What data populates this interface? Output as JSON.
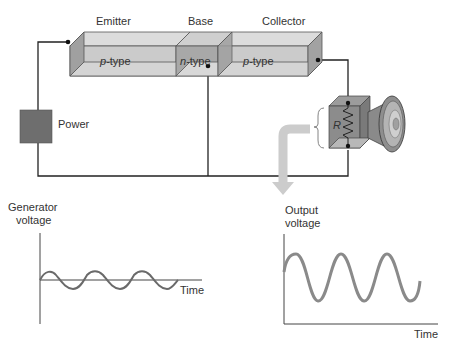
{
  "diagram": {
    "regions": [
      {
        "label": "Emitter",
        "type_prefix": "p",
        "type_suffix": "-type"
      },
      {
        "label": "Base",
        "type_prefix": "n",
        "type_suffix": "-type"
      },
      {
        "label": "Collector",
        "type_prefix": "p",
        "type_suffix": "-type"
      }
    ],
    "power_label": "Power",
    "resistor_label": "R",
    "speaker": "speaker-icon",
    "arrow": "down-arrow"
  },
  "graphs": {
    "input": {
      "ylabel_line1": "Generator",
      "ylabel_line2": "voltage",
      "xlabel": "Time",
      "amplitude": "small",
      "cycles": 3
    },
    "output": {
      "ylabel_line1": "Output",
      "ylabel_line2": "voltage",
      "xlabel": "Time",
      "amplitude": "large",
      "cycles": 3
    }
  },
  "colors": {
    "block_face": "#c8c8c8",
    "block_top": "#dadada",
    "block_side": "#9a9a9a",
    "base_face": "#a6a6a6",
    "power_box": "#6e6e6e",
    "wave": "#8a8a8a",
    "arrow": "#cccccc"
  }
}
